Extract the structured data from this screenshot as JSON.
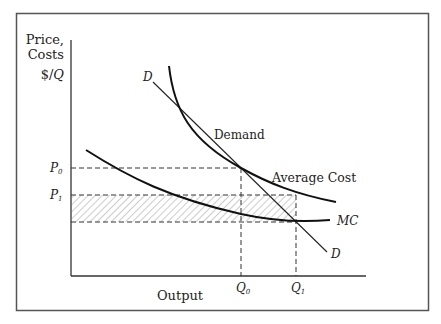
{
  "figure": {
    "y_axis_label_line1": "Price,",
    "y_axis_label_line2": "Costs",
    "y_axis_unit_prefix": "$/",
    "y_axis_unit_var": "Q",
    "x_axis_label": "Output",
    "price_labels": [
      {
        "letter": "P",
        "sub": "0"
      },
      {
        "letter": "P",
        "sub": "1"
      }
    ],
    "quantity_labels": [
      {
        "letter": "Q",
        "sub": "0"
      },
      {
        "letter": "Q",
        "sub": "1"
      }
    ],
    "curve_labels": {
      "demand_top": "D",
      "demand_name": "Demand",
      "demand_bottom": "D",
      "average_cost": "Average Cost",
      "marginal_cost": "MC"
    },
    "colors": {
      "curve": "#111111",
      "frame": "#555555",
      "dashed": "#333333",
      "hatch": "#888888"
    }
  },
  "diagram_data": {
    "type": "economics-cost-curves",
    "curves": [
      "Demand (D)",
      "Average Cost",
      "Marginal Cost (MC)"
    ],
    "points": {
      "P0_Q0": "Demand intersects Average Cost",
      "P1_Q1": "Demand intersects MC"
    },
    "shaded_region": "Rectangle between P1 and MC level at Q1, from axis to Q1"
  }
}
